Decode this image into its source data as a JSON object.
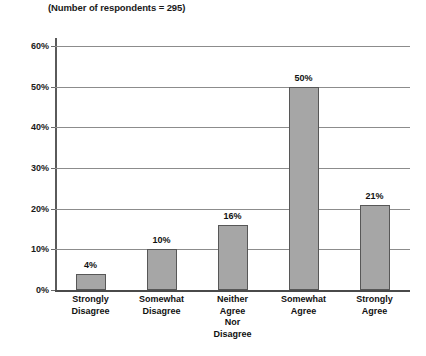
{
  "chart_data": {
    "type": "bar",
    "title": "(Number of respondents = 295)",
    "xlabel": "",
    "ylabel": "",
    "categories": [
      "Strongly Disagree",
      "Somewhat Disagree",
      "Neither Agree Nor Disagree",
      "Somewhat Agree",
      "Strongly Agree"
    ],
    "category_lines": [
      [
        "Strongly",
        "Disagree"
      ],
      [
        "Somewhat",
        "Disagree"
      ],
      [
        "Neither",
        "Agree",
        "Nor",
        "Disagree"
      ],
      [
        "Somewhat",
        "Agree"
      ],
      [
        "Strongly",
        "Agree"
      ]
    ],
    "values": [
      4,
      10,
      16,
      50,
      21
    ],
    "value_labels": [
      "4%",
      "10%",
      "16%",
      "50%",
      "21%"
    ],
    "ylim": [
      0,
      60
    ],
    "ytick_values": [
      0,
      10,
      20,
      30,
      40,
      50,
      60
    ],
    "ytick_labels": [
      "0%",
      "10%",
      "20%",
      "30%",
      "40%",
      "50%",
      "60%"
    ],
    "grid": true,
    "legend": "none",
    "bar_color": "#a6a6a6",
    "bar_border_color": "#575757",
    "gridline_color": "#8c8c8c",
    "axis_color": "#5a5a5a",
    "text_color": "#111111"
  }
}
